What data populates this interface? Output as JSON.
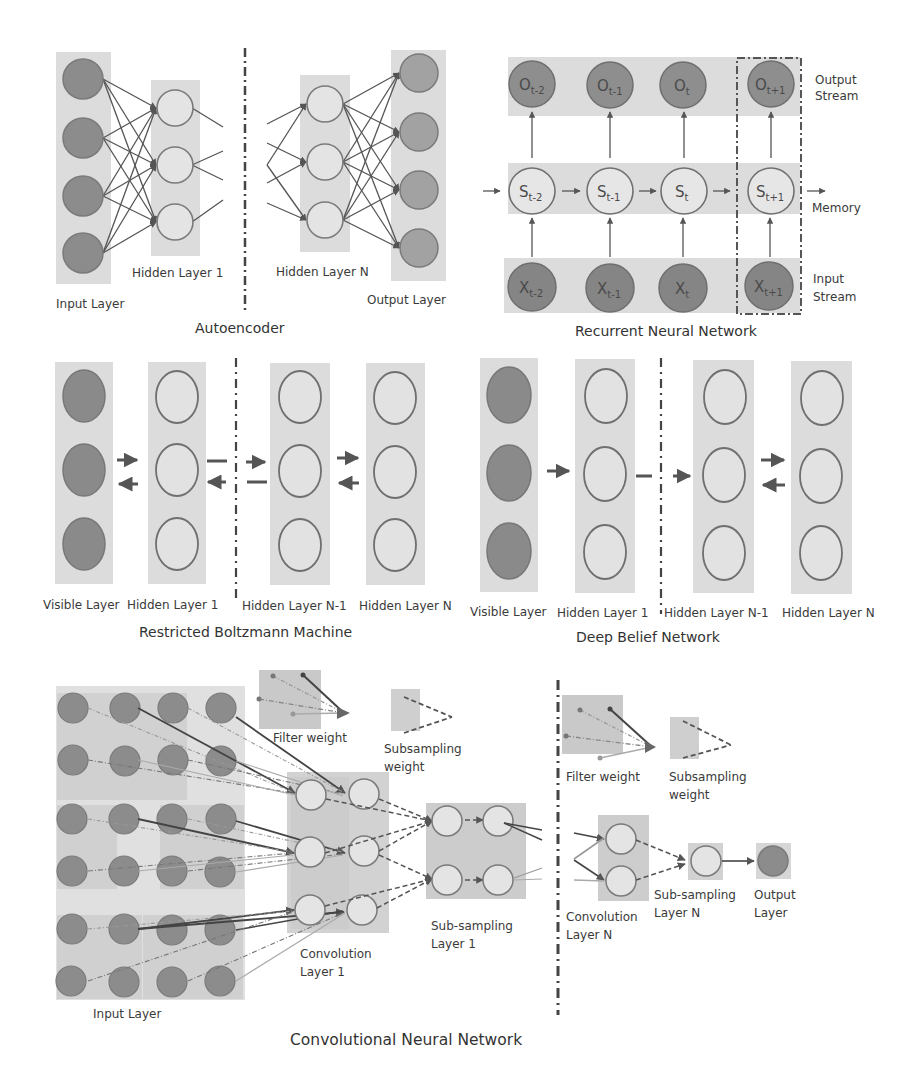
{
  "header": {
    "caption_fragment": ""
  },
  "colors": {
    "layer_box": "#dcdcdc",
    "filled_node": "#8c8c8c",
    "filled_node_stroke": "#777777",
    "light_node": "#e4e4e4",
    "node_stroke": "#8a8a8a",
    "edge": "#555555",
    "divider": "#444444",
    "text": "#3a3a3a"
  },
  "autoencoder": {
    "title": "Autoencoder",
    "labels": {
      "input_layer": "Input Layer",
      "hidden_layer_1": "Hidden Layer 1",
      "hidden_layer_n": "Hidden Layer N",
      "output_layer": "Output Layer"
    }
  },
  "rnn": {
    "title": "Recurrent Neural Network",
    "labels": {
      "output_stream_1": "Output",
      "output_stream_2": "Stream",
      "memory": "Memory",
      "input_stream_1": "Input",
      "input_stream_2": "Stream"
    },
    "outputs": [
      {
        "base": "O",
        "sub": "t-2"
      },
      {
        "base": "O",
        "sub": "t-1"
      },
      {
        "base": "O",
        "sub": "t"
      },
      {
        "base": "O",
        "sub": "t+1"
      }
    ],
    "states": [
      {
        "base": "S",
        "sub": "t-2"
      },
      {
        "base": "S",
        "sub": "t-1"
      },
      {
        "base": "S",
        "sub": "t"
      },
      {
        "base": "S",
        "sub": "t+1"
      }
    ],
    "inputs": [
      {
        "base": "X",
        "sub": "t-2"
      },
      {
        "base": "X",
        "sub": "t-1"
      },
      {
        "base": "X",
        "sub": "t"
      },
      {
        "base": "X",
        "sub": "t+1"
      }
    ]
  },
  "rbm": {
    "title": "Restricted Boltzmann Machine",
    "labels": {
      "visible_layer": "Visible Layer",
      "hidden_layer_1": "Hidden Layer 1",
      "hidden_layer_n_minus_1": "Hidden Layer N-1",
      "hidden_layer_n": "Hidden Layer N"
    }
  },
  "dbn": {
    "title": "Deep Belief Network",
    "labels": {
      "visible_layer": "Visible Layer",
      "hidden_layer_1": "Hidden Layer 1",
      "hidden_layer_n_minus_1": "Hidden Layer N-1",
      "hidden_layer_n": "Hidden Layer N"
    }
  },
  "cnn": {
    "title": "Convolutional Neural Network",
    "labels": {
      "input_layer": "Input Layer",
      "filter_weight": "Filter weight",
      "subsampling_weight_1": "Subsampling",
      "subsampling_weight_2": "weight",
      "convolution_layer_1_a": "Convolution",
      "convolution_layer_1_b": "Layer 1",
      "subsampling_layer_1_a": "Sub-sampling",
      "subsampling_layer_1_b": "Layer 1",
      "filter_weight_right": "Filter weight",
      "subsampling_weight_right_1": "Subsampling",
      "subsampling_weight_right_2": "weight",
      "convolution_layer_n_a": "Convolution",
      "convolution_layer_n_b": "Layer N",
      "subsampling_layer_n_a": "Sub-sampling",
      "subsampling_layer_n_b": "Layer N",
      "output_layer_a": "Output",
      "output_layer_b": "Layer"
    }
  }
}
